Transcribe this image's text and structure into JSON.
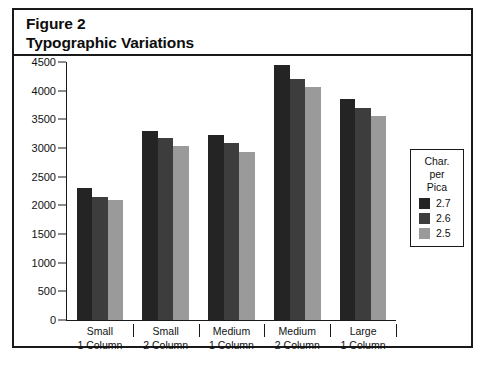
{
  "figure": {
    "title_line1": "Figure 2",
    "title_line2": "Typographic Variations"
  },
  "legend": {
    "title_line1": "Char.",
    "title_line2": "per",
    "title_line3": "Pica",
    "entries": [
      {
        "label": "2.7",
        "color": "#242424"
      },
      {
        "label": "2.6",
        "color": "#3d3d3d"
      },
      {
        "label": "2.5",
        "color": "#9a9a9a"
      }
    ]
  },
  "chart_data": {
    "type": "bar",
    "xlabel": "",
    "ylabel": "",
    "ylim": [
      0,
      4500
    ],
    "yticks": [
      0,
      500,
      1000,
      1500,
      2000,
      2500,
      3000,
      3500,
      4000,
      4500
    ],
    "ytick_labels": [
      "0",
      "500",
      "1000",
      "1500",
      "2000",
      "2500",
      "3000",
      "3500",
      "4000",
      "4500"
    ],
    "grid": false,
    "legend_position": "right",
    "legend_title": "Char. per Pica",
    "categories": [
      "Small 1 Column",
      "Small 2 Column",
      "Medium 1 Column",
      "Medium 2 Column",
      "Large 1 Column"
    ],
    "category_lines": [
      {
        "line1": "Small",
        "line2": "1 Column"
      },
      {
        "line1": "Small",
        "line2": "2 Column"
      },
      {
        "line1": "Medium",
        "line2": "1 Column"
      },
      {
        "line1": "Medium",
        "line2": "2 Column"
      },
      {
        "line1": "Large",
        "line2": "1 Column"
      }
    ],
    "series": [
      {
        "name": "2.7",
        "color": "#242424",
        "values": [
          2300,
          3300,
          3220,
          4440,
          3850
        ]
      },
      {
        "name": "2.6",
        "color": "#3d3d3d",
        "values": [
          2150,
          3180,
          3080,
          4200,
          3700
        ]
      },
      {
        "name": "2.5",
        "color": "#9a9a9a",
        "values": [
          2100,
          3030,
          2930,
          4070,
          3550
        ]
      }
    ]
  }
}
